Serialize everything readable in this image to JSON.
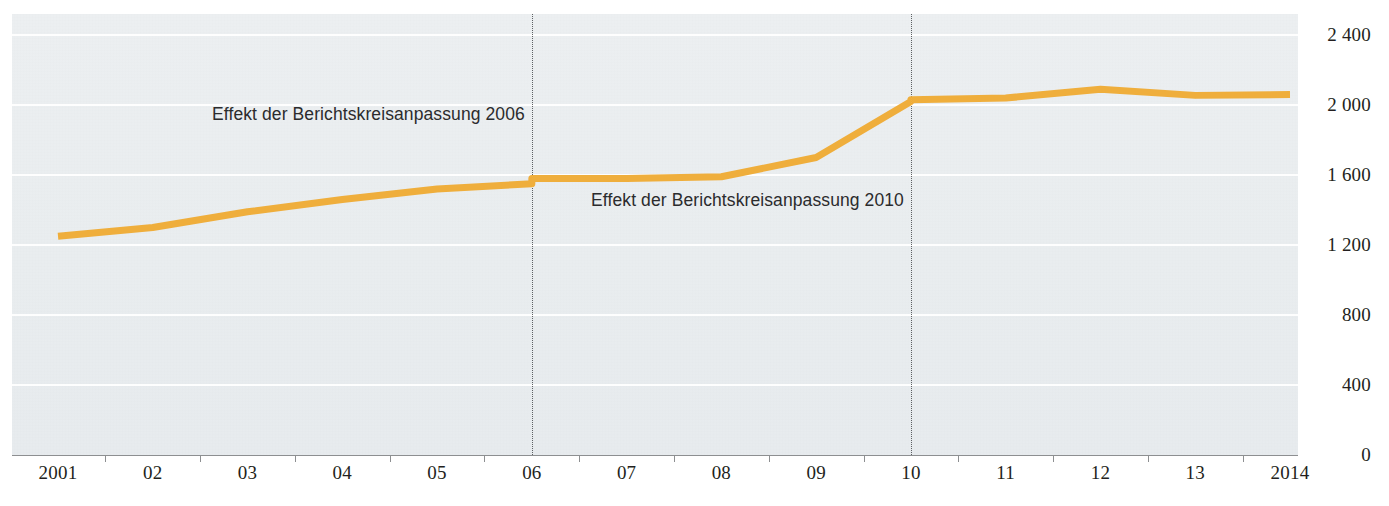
{
  "chart_data": {
    "type": "line",
    "title": "",
    "subtitle": "",
    "xlabel": "",
    "ylabel": "",
    "grid": true,
    "legend": "none",
    "ylim": [
      0,
      2400
    ],
    "y_ticks": [
      "0",
      "400",
      "800",
      "1 200",
      "1 600",
      "2 000",
      "2 400"
    ],
    "y_tick_values": [
      0,
      400,
      800,
      1200,
      1600,
      2000,
      2400
    ],
    "categories": [
      "2001",
      "02",
      "03",
      "04",
      "05",
      "06",
      "07",
      "08",
      "09",
      "10",
      "11",
      "12",
      "13",
      "2014"
    ],
    "x": [
      2001,
      2002,
      2003,
      2004,
      2005,
      2006,
      2007,
      2008,
      2009,
      2010,
      2011,
      2012,
      2013,
      2014
    ],
    "series": [
      {
        "name": "Zeitreihe",
        "color": "#EFAE3C",
        "values": [
          1250,
          1300,
          1390,
          1460,
          1520,
          1560,
          1580,
          1590,
          1700,
          2030,
          2040,
          2090,
          2055,
          2060
        ],
        "break_points": [
          {
            "year": 2006,
            "value_before": 1550,
            "value_after": 1580
          },
          {
            "year": 2010,
            "value_before": 2020,
            "value_after": 2030
          }
        ]
      }
    ],
    "annotations": [
      {
        "text": "Effekt der Berichtskreisanpassung 2006",
        "at_year": 2006,
        "at_value": 1950
      },
      {
        "text": "Effekt der Berichtskreisanpassung 2010",
        "at_year": 2010,
        "at_value": 1460
      }
    ],
    "event_lines": [
      {
        "year": 2006,
        "style": "dotted"
      },
      {
        "year": 2010,
        "style": "dotted"
      }
    ]
  },
  "colors": {
    "series": "#EFAE3C",
    "panel_background": "#eceff1",
    "gridline": "#ffffff",
    "axis": "#8d8f91",
    "text": "#231f20",
    "event_line": "#5d6063"
  }
}
